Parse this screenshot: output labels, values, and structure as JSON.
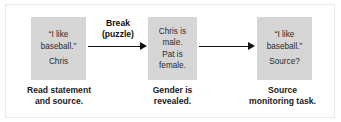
{
  "figure": {
    "type": "process-flow-diagram",
    "box_fill_color": "#d5d5d5",
    "arrow_color": "#111111",
    "text_color": "#1a1a1a"
  },
  "steps": [
    {
      "id": "step-1",
      "box_lines": [
        "“I like",
        "baseball.”",
        "Chris"
      ],
      "caption_lines": [
        "Read statement",
        "and source."
      ]
    },
    {
      "id": "step-2",
      "box_lines": [
        "Chris is",
        "male.",
        "Pat is",
        "female."
      ],
      "caption_lines": [
        "Gender is",
        "revealed."
      ]
    },
    {
      "id": "step-3",
      "box_lines": [
        "“I like",
        "baseball.”",
        "Source?"
      ],
      "caption_lines": [
        "Source",
        "monitoring task."
      ]
    }
  ],
  "arrows": [
    {
      "id": "arrow-1",
      "label_lines": [
        "Break",
        "(puzzle)"
      ],
      "from": "step-1",
      "to": "step-2"
    },
    {
      "id": "arrow-2",
      "label_lines": [],
      "from": "step-2",
      "to": "step-3"
    }
  ]
}
